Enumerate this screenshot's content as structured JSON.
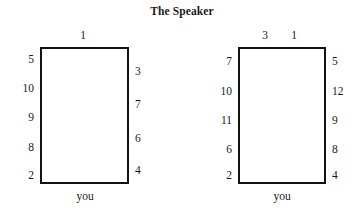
{
  "title": "The Speaker",
  "diagrams": [
    {
      "name": "left-seating-diagram",
      "you_label": "you",
      "top_seats": [
        {
          "value": "1",
          "x": 83
        }
      ],
      "left_seats": [
        {
          "value": "5",
          "y": 60
        },
        {
          "value": "10",
          "y": 89
        },
        {
          "value": "9",
          "y": 118
        },
        {
          "value": "8",
          "y": 148
        },
        {
          "value": "2",
          "y": 176
        }
      ],
      "right_seats": [
        {
          "value": "3",
          "y": 72
        },
        {
          "value": "7",
          "y": 105
        },
        {
          "value": "6",
          "y": 139
        },
        {
          "value": "4",
          "y": 171
        }
      ]
    },
    {
      "name": "right-seating-diagram",
      "you_label": "you",
      "top_seats": [
        {
          "value": "3",
          "x": 83
        },
        {
          "value": "1",
          "x": 112
        }
      ],
      "left_seats": [
        {
          "value": "7",
          "y": 62
        },
        {
          "value": "10",
          "y": 92
        },
        {
          "value": "11",
          "y": 121
        },
        {
          "value": "6",
          "y": 150
        },
        {
          "value": "2",
          "y": 176
        }
      ],
      "right_seats": [
        {
          "value": "5",
          "y": 62
        },
        {
          "value": "12",
          "y": 92
        },
        {
          "value": "9",
          "y": 121
        },
        {
          "value": "8",
          "y": 150
        },
        {
          "value": "4",
          "y": 176
        }
      ]
    }
  ]
}
